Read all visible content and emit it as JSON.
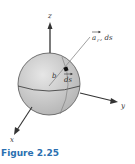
{
  "figure": {
    "caption": "Figure 2.25",
    "labels": {
      "z_axis": "z",
      "y_axis": "y",
      "x_axis": "x",
      "radius": "b",
      "vector_ar": "a",
      "vector_ar_sub": "r",
      "vector_ar_suffix": ", ds",
      "ds": "ds"
    },
    "colors": {
      "sphere": "#c8c8c8",
      "axis": "#333333",
      "caption": "#2a6fb0"
    }
  }
}
